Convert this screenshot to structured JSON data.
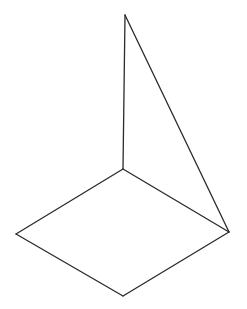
{
  "diagram": {
    "type": "line-drawing",
    "stroke_color": "#2a2a2a",
    "background": "#ffffff",
    "points": {
      "apex": [
        125,
        15
      ],
      "back": [
        123,
        169
      ],
      "left": [
        16,
        234
      ],
      "front": [
        123,
        296
      ],
      "right": [
        229,
        232
      ]
    },
    "edges": [
      {
        "name": "vertical-pole",
        "from": "apex",
        "to": "back"
      },
      {
        "name": "diagonal-edge",
        "from": "apex",
        "to": "right"
      },
      {
        "name": "base-back-left",
        "from": "back",
        "to": "left"
      },
      {
        "name": "base-left-front",
        "from": "left",
        "to": "front"
      },
      {
        "name": "base-front-right",
        "from": "front",
        "to": "right"
      },
      {
        "name": "base-right-back",
        "from": "right",
        "to": "back"
      }
    ]
  }
}
